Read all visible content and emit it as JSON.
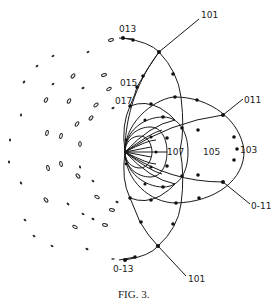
{
  "figure": {
    "caption": "FIG. 3.",
    "type": "stereographic projection diagram",
    "colors": {
      "ink": "#1a1a1a",
      "background": "#ffffff"
    },
    "pole_labels": {
      "p013": "013",
      "p101_top": "101",
      "p015": "015",
      "p017": "017",
      "p011": "011",
      "p107": "107",
      "p105": "105",
      "p103": "103",
      "p0m11": "0-11",
      "p0m13": "0-13",
      "p101_bottom": "101"
    },
    "spot_pattern": {
      "description": "array of small elliptical diffraction spots to the left of the projection",
      "approx_count": 42
    }
  }
}
